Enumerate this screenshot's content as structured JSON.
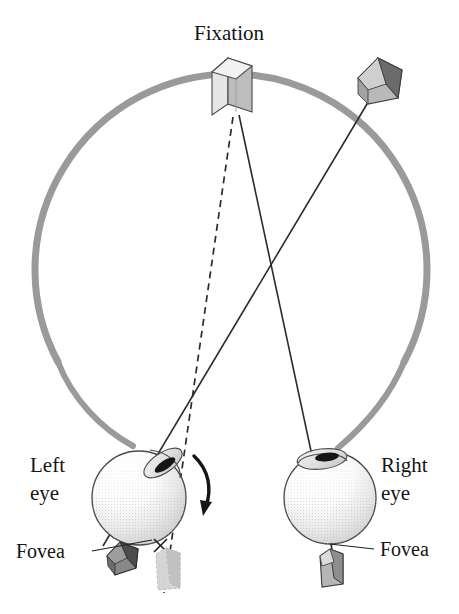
{
  "figure": {
    "background_color": "#ffffff"
  },
  "labels": {
    "fixation": "Fixation",
    "left_eye_line1": "Left",
    "left_eye_line2": "eye",
    "right_eye_line1": "Right",
    "right_eye_line2": "eye",
    "fovea_left": "Fovea",
    "fovea_right": "Fovea"
  },
  "colors": {
    "arc": "#9a9a9a",
    "line": "#2b2b2b",
    "text": "#151515",
    "eye_outline": "#4a4a4a",
    "eye_fill_light": "#fdfdfd",
    "eye_shade": "#d9d9d9",
    "object_light": "#d0d0d0",
    "object_mid": "#a8a8a8",
    "object_dark": "#6e6e6e",
    "object_darker": "#4e4e4e",
    "ghost": "#c9c9c9",
    "pupil": "#1a1a1a"
  },
  "geometry": {
    "arc": {
      "center_x": 231,
      "center_y": 270,
      "radius": 196,
      "stroke_width": 7,
      "start_angle_deg": 152,
      "end_angle_deg": 28
    },
    "fixation_target": {
      "label": "near vertical box on arc",
      "x": 212,
      "y": 58,
      "width": 40,
      "height": 57
    },
    "far_target": {
      "label": "pentagon block right of fixation",
      "cx": 381,
      "cy": 85,
      "radius": 30
    },
    "left_eye": {
      "cx": 139,
      "cy": 498,
      "r": 47,
      "tilt_deg": -22
    },
    "right_eye": {
      "cx": 330,
      "cy": 498,
      "r": 46,
      "tilt_deg": 0
    },
    "crossing_point": {
      "x": 271,
      "y": 267
    },
    "rotation_arrow": {
      "label": "curved arrow showing left eye rotation",
      "direction": "clockwise-down"
    }
  },
  "rays": [
    {
      "name": "left-eye-to-fixation-dashed",
      "style": "dashed",
      "from_x": 234,
      "from_y": 118,
      "to_x": 163,
      "to_y": 592
    },
    {
      "name": "left-eye-to-far-target-solid",
      "style": "solid",
      "from_x": 371,
      "from_y": 100,
      "to_x": 104,
      "to_y": 545
    },
    {
      "name": "right-eye-to-fixation-solid",
      "style": "solid",
      "from_x": 240,
      "from_y": 116,
      "to_x": 331,
      "to_y": 548
    }
  ],
  "annotations": {
    "left_fovea_marker": "x-cross at left eye fovea",
    "left_image_pentagon": "dark pentagon image below left eye",
    "left_image_ghost_box": "faded dashed box below left eye",
    "right_image_box": "small gray box below right eye"
  }
}
